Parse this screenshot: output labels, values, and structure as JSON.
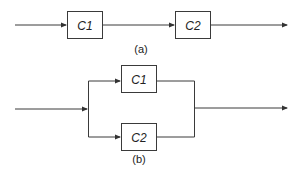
{
  "diagram_a": {
    "caption": "(a)",
    "blocks": [
      {
        "id": "C1",
        "label": "C1"
      },
      {
        "id": "C2",
        "label": "C2"
      }
    ],
    "connection": "series"
  },
  "diagram_b": {
    "caption": "(b)",
    "blocks": [
      {
        "id": "C1",
        "label": "C1"
      },
      {
        "id": "C2",
        "label": "C2"
      }
    ],
    "connection": "parallel"
  }
}
